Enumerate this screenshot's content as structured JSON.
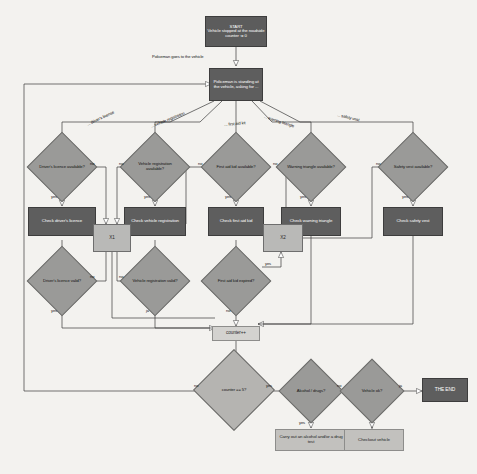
{
  "diagram": {
    "colors": {
      "background": "#f3f2ef",
      "process_fill": "#5e5e5e",
      "decision_fill": "#9a9a98",
      "merge_fill": "#b9b9b7",
      "action_fill": "#c2c1be",
      "line": "#3a3a3a"
    },
    "nodes": {
      "start": "START\nVehicle stopped at the roadside\ncounter := 0",
      "policeman": "Policeman is standing at the vehicle, asking for ...",
      "d_licence_avail": "Driver's licence available?",
      "d_registration_avail": "Vehicle registration available?",
      "d_firstaid_avail": "First aid kid available?",
      "d_triangle_avail": "Warning triangle available?",
      "d_vest_avail": "Safety vest available?",
      "p_check_licence": "Check driver's licence",
      "p_check_registration": "Check vehicle registration",
      "p_check_firstaid": "Check first aid kid",
      "p_check_triangle": "Check warning triangle",
      "p_check_vest": "Check safety vest",
      "d_licence_valid": "Driver's licence valid?",
      "d_registration_valid": "Vehicle registration valid?",
      "d_firstaid_expired": "First aid kid expired?",
      "merge_x1": "X1",
      "merge_x2": "X2",
      "counter": "counter++",
      "d_counter_eq5": "counter == 5?",
      "d_alcohol": "Alcohol / drugs?",
      "d_vehicle_ok": "Vehicle ok?",
      "p_drug_test": "Carry out an alcohol and/or a drug test",
      "p_checkout": "Checkout vehicle",
      "end": "THE END"
    },
    "edge_labels": {
      "goes_to_vehicle": "Policeman goes to the vehicle",
      "ask_licence": "... driver's license",
      "ask_registration": "... vehicle registration",
      "ask_firstaid": "... first aid kit",
      "ask_triangle": "... warning triangle",
      "ask_vest": "... safety vest",
      "no1": "no",
      "no2": "no",
      "no3": "no",
      "no4": "no",
      "no5": "no",
      "no6": "no",
      "no7": "no",
      "no8": "no",
      "no9": "no",
      "no10": "no",
      "yes1": "yes",
      "yes2": "yes",
      "yes3": "yes",
      "yes4": "yes",
      "yes5": "yes",
      "yes6": "yes",
      "yes7": "yes",
      "yes8": "yes",
      "yes9": "yes",
      "ja1": "ja",
      "ja2": "ja"
    }
  }
}
